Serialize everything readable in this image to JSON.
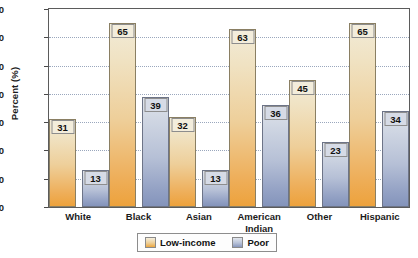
{
  "chart_data": {
    "type": "bar",
    "title": "",
    "xlabel": "",
    "ylabel": "Percent (%)",
    "ylim": [
      0,
      70
    ],
    "yticks": [
      0,
      10,
      20,
      30,
      40,
      50,
      60,
      70
    ],
    "grid": true,
    "legend_position": "bottom",
    "categories": [
      "White",
      "Black",
      "Asian",
      "American Indian",
      "Other",
      "Hispanic"
    ],
    "category_lines": [
      [
        "White"
      ],
      [
        "Black"
      ],
      [
        "Asian"
      ],
      [
        "American",
        "Indian"
      ],
      [
        "Other"
      ],
      [
        "Hispanic"
      ]
    ],
    "series": [
      {
        "name": "Low-income",
        "color": "#eeb154",
        "values": [
          31,
          65,
          32,
          63,
          45,
          65
        ]
      },
      {
        "name": "Poor",
        "color": "#93a1c4",
        "values": [
          13,
          39,
          13,
          36,
          23,
          34
        ]
      }
    ]
  },
  "legend": {
    "items": [
      {
        "label": "Low-income"
      },
      {
        "label": "Poor"
      }
    ]
  }
}
